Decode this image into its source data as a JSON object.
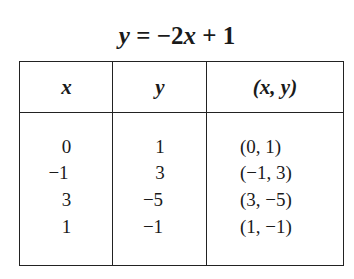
{
  "title": {
    "lhs": "y",
    "eq": " = −2",
    "var": "x",
    "rest": " + 1"
  },
  "table": {
    "headers": [
      "x",
      "y",
      "(x, y)"
    ],
    "rows": [
      {
        "x": "0",
        "y": "1",
        "pair": "(0, 1)"
      },
      {
        "x": "−1",
        "y": "3",
        "pair": "(−1, 3)"
      },
      {
        "x": "3",
        "y": "−5",
        "pair": "(3, −5)"
      },
      {
        "x": "1",
        "y": "−1",
        "pair": "(1, −1)"
      }
    ]
  }
}
